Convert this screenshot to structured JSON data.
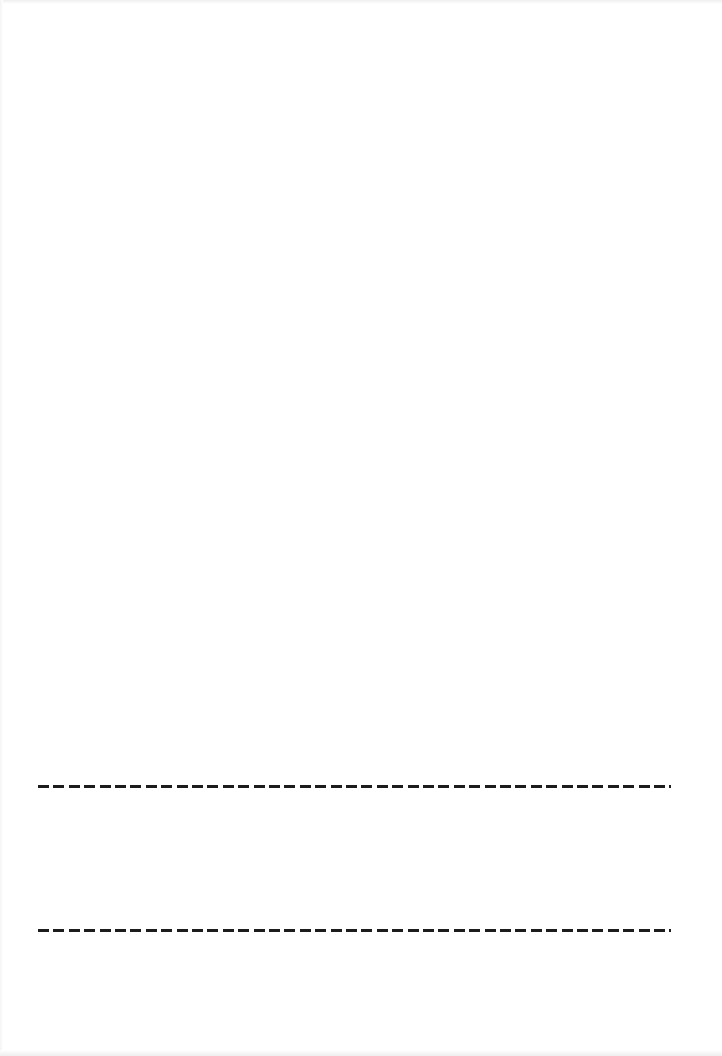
{
  "page": {
    "type": "blank-form-page",
    "background_color": "#ffffff",
    "rule_color": "#1c1c1c",
    "rules": [
      {
        "id": "line-1",
        "style": "dashed",
        "value": ""
      },
      {
        "id": "line-2",
        "style": "dashed",
        "value": ""
      }
    ]
  }
}
